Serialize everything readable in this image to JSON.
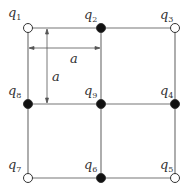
{
  "diagram": {
    "type": "charge grid",
    "spacing_label": "a",
    "dimension_labels": [
      {
        "id": "horizontal",
        "text": "a"
      },
      {
        "id": "vertical",
        "text": "a"
      }
    ],
    "charges": [
      {
        "name": "q",
        "index": "1",
        "fill": "open"
      },
      {
        "name": "q",
        "index": "2",
        "fill": "solid"
      },
      {
        "name": "q",
        "index": "3",
        "fill": "open"
      },
      {
        "name": "q",
        "index": "4",
        "fill": "solid"
      },
      {
        "name": "q",
        "index": "5",
        "fill": "open"
      },
      {
        "name": "q",
        "index": "6",
        "fill": "solid"
      },
      {
        "name": "q",
        "index": "7",
        "fill": "open"
      },
      {
        "name": "q",
        "index": "8",
        "fill": "solid"
      },
      {
        "name": "q",
        "index": "9",
        "fill": "solid"
      }
    ],
    "colors": {
      "line": "#666666",
      "solid": "#111111",
      "open": "#ffffff"
    }
  }
}
